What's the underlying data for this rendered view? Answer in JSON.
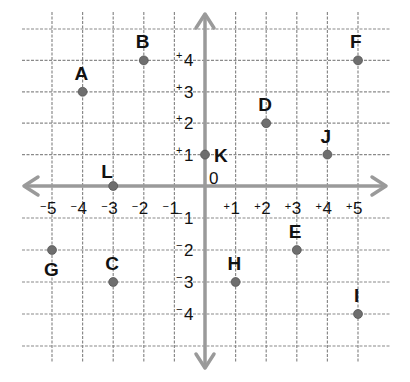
{
  "chart_data": {
    "type": "scatter",
    "title": "",
    "xlabel": "",
    "ylabel": "",
    "xlim": [
      -5,
      5
    ],
    "ylim": [
      -5,
      5
    ],
    "grid": true,
    "origin_label": "0",
    "x_ticks": [
      "-5",
      "-4",
      "-3",
      "-2",
      "-1",
      "+1",
      "+2",
      "+3",
      "+4",
      "+5"
    ],
    "y_ticks": [
      "+4",
      "+3",
      "+2",
      "+1",
      "-1",
      "-2",
      "-3",
      "-4"
    ],
    "points": [
      {
        "label": "A",
        "x": -4,
        "y": 3
      },
      {
        "label": "B",
        "x": -2,
        "y": 4
      },
      {
        "label": "C",
        "x": -3,
        "y": -3
      },
      {
        "label": "D",
        "x": 2,
        "y": 2
      },
      {
        "label": "E",
        "x": 3,
        "y": -2
      },
      {
        "label": "F",
        "x": 5,
        "y": 4
      },
      {
        "label": "G",
        "x": -5,
        "y": -2
      },
      {
        "label": "H",
        "x": 1,
        "y": -3
      },
      {
        "label": "I",
        "x": 5,
        "y": -4
      },
      {
        "label": "J",
        "x": 4,
        "y": 1
      },
      {
        "label": "K",
        "x": 0,
        "y": 1
      },
      {
        "label": "L",
        "x": -3,
        "y": 0
      }
    ]
  },
  "colors": {
    "grid": "#8a8a8a",
    "axis": "#9a9a9a",
    "point": "#6e6e6e",
    "text": "#111111"
  }
}
